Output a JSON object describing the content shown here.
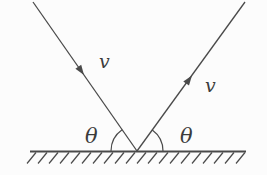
{
  "diagram": {
    "labels": {
      "incoming_velocity": "v",
      "outgoing_velocity": "v",
      "incidence_angle": "θ",
      "reflection_angle": "θ"
    },
    "colors": {
      "stroke": "#4a4a4a",
      "background": "#fcfcfc"
    }
  }
}
